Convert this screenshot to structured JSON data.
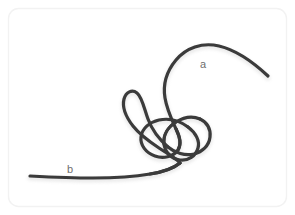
{
  "figure": {
    "kind": "photograph",
    "background_color": "#ffffff",
    "border_color": "#f2f2f2",
    "border_radius_px": 10,
    "rope_color": "#3a3a3a",
    "rope_shadow_color": "#cfcfcf",
    "rope_width_px": 3.2,
    "width_px": 295,
    "height_px": 215
  },
  "labels": [
    {
      "id": "a",
      "text": "a",
      "x": 205,
      "y": 65,
      "color": "#6f6f6f",
      "describes": "free-end-upper-right"
    },
    {
      "id": "b",
      "text": "b",
      "x": 71,
      "y": 170,
      "color": "#6f6f6f",
      "describes": "free-end-lower-left"
    }
  ],
  "rope": {
    "end_a_point": [
      268,
      76
    ],
    "end_b_point": [
      30,
      176
    ],
    "strand_paths": [
      "M268,76 C253,62 236,50 219,46 C202,42 186,48 176,60 C166,72 163,86 165,98 C167,110 172,120 176,129",
      "M176,129 C180,137 182,144 178,150 C173,157 163,159 155,156 C146,153 140,145 141,137 C142,128 150,122 159,120 C169,118 180,121 188,127",
      "M188,127 C196,133 200,141 198,148 C196,156 188,161 180,160 C171,159 165,152 164,144 C163,135 168,127 176,122 C184,117 193,116 200,119",
      "M200,119 C207,122 211,129 210,137 C209,146 202,152 194,154 C185,156 175,153 168,147",
      "M168,147 C160,140 152,130 148,119 C144,108 142,97 137,93 C132,89 126,92 124,99 C122,107 126,117 133,126 C140,135 150,142 159,148 C168,154 176,158 180,163",
      "M180,163 C174,168 163,172 150,174 C133,177 113,178 93,178 C72,178 50,177 30,176"
    ]
  },
  "icons": {
    "rope_strand": "rope-strand-icon"
  }
}
